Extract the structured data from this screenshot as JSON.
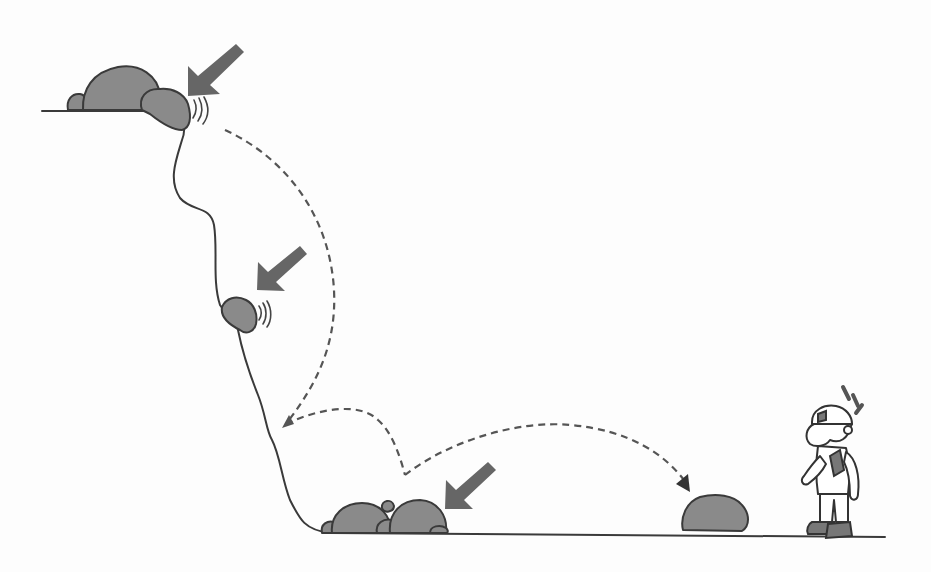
{
  "diagram": {
    "title": "",
    "colors": {
      "background": "#fdfdfd",
      "ink": "#3a3a3a",
      "rock_fill": "#8a8a8a",
      "arrow_fill": "#666666",
      "trajectory": "#555555"
    },
    "elements": [
      {
        "id": "cliff-top-rocks",
        "type": "rock-cluster",
        "position": "cliff top",
        "count": 4,
        "has_vibration_marks": true,
        "has_indicator_arrow": true
      },
      {
        "id": "mid-cliff-rock",
        "type": "rock",
        "position": "middle of cliff face",
        "has_vibration_marks": true,
        "has_indicator_arrow": true
      },
      {
        "id": "base-rocks",
        "type": "rock-cluster",
        "position": "cliff base",
        "count": 5,
        "has_indicator_arrow": true
      },
      {
        "id": "fallen-rock",
        "type": "rock",
        "position": "ground near worker"
      },
      {
        "id": "rockfall-trajectory",
        "type": "dashed-path",
        "description": "bouncing path from cliff top to ground rock",
        "bounces": 2
      },
      {
        "id": "worker",
        "type": "person",
        "description": "worker in hard hat pointing at fallen rock",
        "has_alert_marks": true
      }
    ],
    "labels": []
  }
}
